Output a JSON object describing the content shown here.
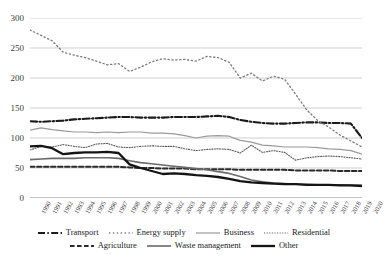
{
  "chart_data": {
    "type": "line",
    "title": "",
    "xlabel": "",
    "ylabel": "",
    "ylim": [
      0,
      300
    ],
    "yticks": [
      0,
      50,
      100,
      150,
      200,
      250,
      300
    ],
    "grid": true,
    "legend_position": "bottom",
    "categories": [
      "1990",
      "1991",
      "1992",
      "1993",
      "1994",
      "1995",
      "1996",
      "1997",
      "1998",
      "1999",
      "2000",
      "2001",
      "2002",
      "2003",
      "2004",
      "2005",
      "2006",
      "2007",
      "2008",
      "2009",
      "2010",
      "2011",
      "2012",
      "2013",
      "2014",
      "2015",
      "2016",
      "2017",
      "2018",
      "2019",
      "2020"
    ],
    "series": [
      {
        "name": "Transport",
        "style": "dash-dot",
        "color": "#1a1a1a",
        "width": 2.1,
        "values": [
          128,
          127,
          128,
          129,
          131,
          132,
          133,
          134,
          135,
          135,
          134,
          134,
          134,
          135,
          135,
          135,
          136,
          137,
          135,
          130,
          127,
          125,
          124,
          124,
          125,
          126,
          126,
          125,
          125,
          124,
          100
        ]
      },
      {
        "name": "Energy supply",
        "style": "dotted-sparse",
        "color": "#7a7a7a",
        "width": 1.3,
        "values": [
          280,
          271,
          262,
          243,
          238,
          234,
          228,
          222,
          224,
          211,
          218,
          227,
          232,
          230,
          231,
          228,
          236,
          234,
          226,
          200,
          208,
          195,
          203,
          198,
          173,
          147,
          129,
          118,
          105,
          95,
          85
        ]
      },
      {
        "name": "Business",
        "style": "solid-thin",
        "color": "#9a9a9a",
        "width": 1.2,
        "values": [
          113,
          117,
          114,
          112,
          110,
          110,
          109,
          110,
          109,
          110,
          110,
          108,
          108,
          107,
          104,
          100,
          103,
          104,
          103,
          96,
          93,
          88,
          87,
          85,
          85,
          85,
          84,
          82,
          81,
          79,
          73
        ]
      },
      {
        "name": "Residential",
        "style": "dotted-fine",
        "color": "#5a5a5a",
        "width": 1.1,
        "values": [
          80,
          86,
          85,
          89,
          86,
          84,
          90,
          91,
          85,
          84,
          86,
          87,
          86,
          86,
          82,
          79,
          81,
          82,
          81,
          75,
          88,
          76,
          79,
          76,
          63,
          67,
          69,
          70,
          69,
          67,
          65
        ]
      },
      {
        "name": "Agriculture",
        "style": "dashed",
        "color": "#2a2a2a",
        "width": 2.0,
        "values": [
          52,
          52,
          52,
          52,
          52,
          52,
          52,
          52,
          52,
          51,
          50,
          50,
          49,
          49,
          49,
          48,
          48,
          48,
          48,
          47,
          47,
          47,
          47,
          47,
          46,
          46,
          46,
          46,
          45,
          45,
          45
        ]
      },
      {
        "name": "Waste management",
        "style": "solid-mid",
        "color": "#6a6a6a",
        "width": 1.6,
        "values": [
          64,
          65,
          66,
          66,
          66,
          67,
          67,
          67,
          66,
          62,
          59,
          57,
          55,
          53,
          51,
          49,
          47,
          44,
          41,
          36,
          30,
          27,
          25,
          24,
          23,
          23,
          22,
          22,
          22,
          21,
          21
        ]
      },
      {
        "name": "Other",
        "style": "solid-thick",
        "color": "#141414",
        "width": 2.3,
        "values": [
          86,
          87,
          83,
          73,
          75,
          76,
          76,
          77,
          75,
          56,
          50,
          45,
          40,
          41,
          40,
          38,
          37,
          35,
          32,
          28,
          26,
          25,
          24,
          23,
          23,
          22,
          22,
          22,
          21,
          21,
          20
        ]
      }
    ]
  },
  "legend": {
    "rows": [
      [
        "Transport",
        "Energy supply",
        "Business",
        "Residential"
      ],
      [
        "Agriculture",
        "Waste management",
        "Other"
      ]
    ]
  }
}
